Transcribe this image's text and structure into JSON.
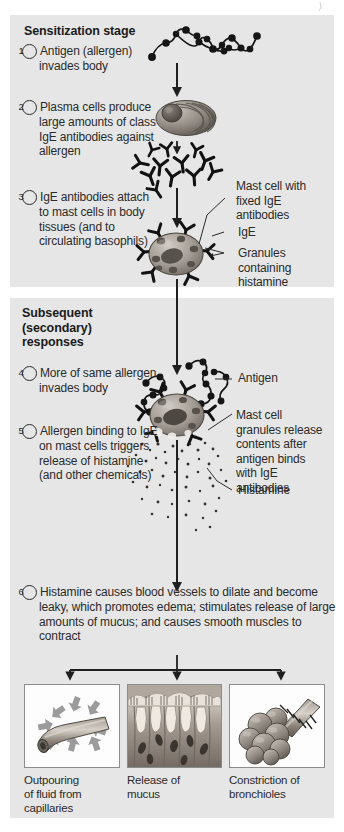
{
  "figure": {
    "background_color": "#ffffff",
    "panel_color": "#e6e6e6",
    "ink_color": "#2b2b2b"
  },
  "panels": [
    {
      "id": "sensitization",
      "heading": "Sensitization stage"
    },
    {
      "id": "subsequent",
      "heading": "Subsequent\n(secondary)\nresponses"
    }
  ],
  "headings": {
    "sensitization": "Sensitization stage",
    "subsequent_line1": "Subsequent",
    "subsequent_line2": "(secondary)",
    "subsequent_line3": "responses"
  },
  "steps": [
    {
      "number": "1",
      "text": "Antigen (allergen) invades body"
    },
    {
      "number": "2",
      "text": "Plasma cells produce large amounts of class IgE antibodies against allergen"
    },
    {
      "number": "3",
      "text": "IgE antibodies attach to mast cells in body tissues (and to circulating basophils)"
    },
    {
      "number": "4",
      "text": "More of same allergen invades body"
    },
    {
      "number": "5",
      "text": "Allergen binding to IgE on mast cells triggers release of histamine (and other chemicals)"
    },
    {
      "number": "6",
      "text": "Histamine causes blood vessels to dilate and become leaky, which promotes edema; stimulates release of large amounts of mucus; and causes smooth muscles to contract"
    }
  ],
  "step_lines": {
    "s1": [
      "Antigen (allergen)",
      "invades body"
    ],
    "s2": [
      "Plasma cells",
      "produce large",
      "amounts of class",
      "IgE antibodies",
      "against allergen"
    ],
    "s3": [
      "IgE antibodies",
      "attach to mast",
      "cells in body",
      "tissues (and to",
      "circulating",
      "basophils)"
    ],
    "s4": [
      "More of",
      "same allergen",
      "invades body"
    ],
    "s5": [
      "Allergen",
      "binding to IgE",
      "on mast cells",
      "triggers release of",
      "histamine (and",
      "other chemicals)"
    ],
    "s6": [
      "Histamine causes blood vessels to dilate and",
      "become leaky, which promotes edema;",
      "stimulates release of large amounts of mucus;",
      "and causes smooth muscles to contract"
    ]
  },
  "callouts": [
    {
      "id": "mast-cell-fixed-ige",
      "lines": [
        "Mast cell with",
        "fixed IgE",
        "antibodies"
      ]
    },
    {
      "id": "ige",
      "lines": [
        "IgE"
      ]
    },
    {
      "id": "granules-histamine",
      "lines": [
        "Granules",
        "containing",
        "histamine"
      ]
    },
    {
      "id": "antigen",
      "lines": [
        "Antigen"
      ]
    },
    {
      "id": "mast-cell-release",
      "lines": [
        "Mast cell",
        "granules release",
        "contents after",
        "antigen binds",
        "with IgE",
        "antibodies"
      ]
    },
    {
      "id": "histamine",
      "lines": [
        "Histamine"
      ]
    }
  ],
  "outcomes": [
    {
      "id": "capillary",
      "lines": [
        "Outpouring",
        "of fluid from",
        "capillaries"
      ],
      "image": "capillary-leak-illustration"
    },
    {
      "id": "mucus",
      "lines": [
        "Release of",
        "mucus"
      ],
      "image": "goblet-cell-epithelium-illustration"
    },
    {
      "id": "bronchiole",
      "lines": [
        "Constriction of",
        "bronchioles"
      ],
      "image": "alveoli-bronchiole-illustration"
    }
  ],
  "illustration_labels": {
    "antigen_chain": "antigen-molecule-chain",
    "plasma_cell": "plasma-cell",
    "antibody_cluster": "ige-antibody-cluster",
    "mast_cell_sensitized": "mast-cell-with-fixed-ige",
    "mast_cell_degranulating": "degranulating-mast-cell",
    "histamine_particles": "histamine-granule-dots",
    "flow_arrows": "downward-flow-arrow"
  }
}
